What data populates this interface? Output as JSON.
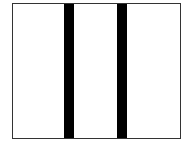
{
  "diagram": {
    "type": "divided-rectangle",
    "frame": {
      "border_color": "#333333",
      "fill_color": "#ffffff"
    },
    "panels": [
      {
        "index": 0,
        "label": ""
      },
      {
        "index": 1,
        "label": ""
      },
      {
        "index": 2,
        "label": ""
      }
    ],
    "dividers": [
      {
        "index": 0,
        "color": "#000000"
      },
      {
        "index": 1,
        "color": "#000000"
      }
    ]
  }
}
